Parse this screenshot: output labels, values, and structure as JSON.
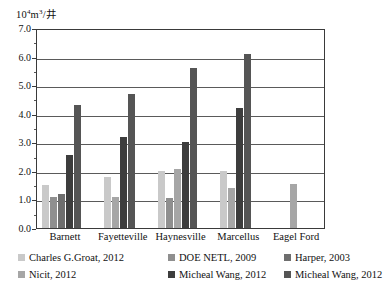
{
  "chart_data": {
    "type": "bar",
    "title": "",
    "xlabel": "",
    "ylabel": "10⁴m³/井",
    "ylabel_parts": {
      "mantissa": "10",
      "exponent": "4",
      "unit": "m",
      "unit_exponent": "3",
      "per": "/井"
    },
    "ylim": [
      0.0,
      7.0
    ],
    "ytick_labels": [
      "0.0",
      "1.0",
      "2.0",
      "3.0",
      "4.0",
      "5.0",
      "6.0",
      "7.0"
    ],
    "ytick_values": [
      0.0,
      1.0,
      2.0,
      3.0,
      4.0,
      5.0,
      6.0,
      7.0
    ],
    "minor_tick_step": 0.5,
    "grid": true,
    "grid_axis": "y",
    "legend_position": "bottom",
    "categories": [
      "Barnett",
      "Fayetteville",
      "Haynesville",
      "Marcellus",
      "Eagel Ford"
    ],
    "series": [
      {
        "name": "Charles G.Groat, 2012",
        "color": "#c9c9c9",
        "values": [
          1.5,
          1.8,
          2.0,
          2.0,
          null
        ]
      },
      {
        "name": "DOE NETL, 2009",
        "color": "#8f8f8f",
        "values": [
          1.1,
          null,
          1.05,
          null,
          null
        ]
      },
      {
        "name": "Harper, 2003",
        "color": "#6e6e6e",
        "values": [
          1.2,
          null,
          null,
          null,
          null
        ]
      },
      {
        "name": "Nicit, 2012",
        "color": "#a6a6a6",
        "values": [
          null,
          1.1,
          2.05,
          1.4,
          1.55
        ]
      },
      {
        "name": "Micheal Wang, 2012",
        "color": "#3d3d3d",
        "values": [
          2.55,
          3.2,
          3.0,
          4.2,
          null
        ]
      },
      {
        "name": "Micheal Wang, 2012",
        "color": "#555555",
        "values": [
          4.3,
          4.7,
          5.6,
          6.1,
          null
        ]
      }
    ]
  },
  "legend": {
    "entries": [
      {
        "label": "Charles G.Groat, 2012",
        "color": "#c9c9c9"
      },
      {
        "label": "DOE NETL, 2009",
        "color": "#8f8f8f"
      },
      {
        "label": "Harper, 2003",
        "color": "#6e6e6e"
      },
      {
        "label": "Nicit, 2012",
        "color": "#a6a6a6"
      },
      {
        "label": "Micheal Wang, 2012",
        "color": "#3d3d3d"
      },
      {
        "label": "Micheal Wang, 2012",
        "color": "#555555"
      }
    ]
  }
}
